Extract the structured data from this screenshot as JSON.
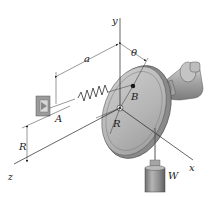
{
  "diagram": {
    "type": "mechanics-figure",
    "labels": {
      "y_axis": "y",
      "x_axis": "x",
      "z_axis": "z",
      "dim_a": "a",
      "angle": "θ",
      "point_A": "A",
      "point_B": "B",
      "radius_disk": "R",
      "radius_offset": "R",
      "weight": "W"
    },
    "components": [
      "wall-bracket",
      "spring",
      "disk",
      "shaft-bearing",
      "cable",
      "hanging-weight",
      "coordinate-axes",
      "dimension-lines"
    ],
    "colors": {
      "disk_face": "#b8b8b8",
      "disk_rim": "#8a8a8a",
      "bearing": "#a9a9a9",
      "weight": "#8c8c8c",
      "lines": "#222222"
    }
  }
}
